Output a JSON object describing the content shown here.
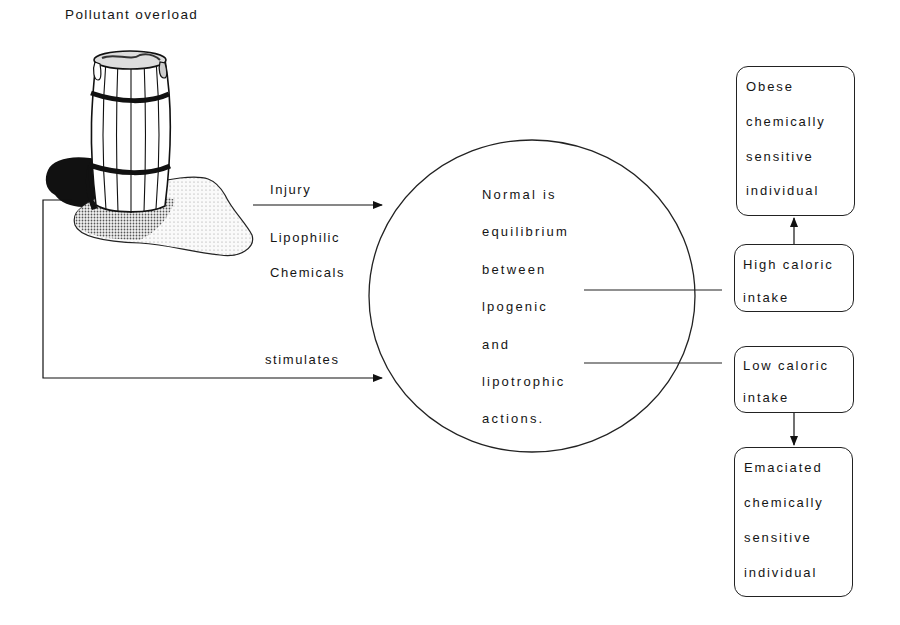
{
  "diagram": {
    "source_label": "Pollutant overload",
    "source_icon": "overflowing-barrel-icon",
    "arrows": {
      "injury_label": "Injury",
      "chemicals_label_1": "Lipophilic",
      "chemicals_label_2": "Chemicals",
      "feedback_label": "stimulates"
    },
    "center": {
      "lines": [
        "Normal is",
        "equilibrium",
        "between",
        "lpogenic",
        "and",
        "lipotrophic",
        "actions."
      ]
    },
    "outcomes": {
      "high_intake": {
        "lines": [
          "High  caloric",
          "intake"
        ]
      },
      "obese": {
        "lines": [
          "Obese",
          "chemically",
          "sensitive",
          "individual"
        ]
      },
      "low_intake": {
        "lines": [
          "Low  caloric",
          "intake"
        ]
      },
      "emaciated": {
        "lines": [
          "Emaciated",
          "chemically",
          "sensitive",
          "individual"
        ]
      }
    },
    "colors": {
      "line": "#222222",
      "background": "#ffffff"
    }
  }
}
